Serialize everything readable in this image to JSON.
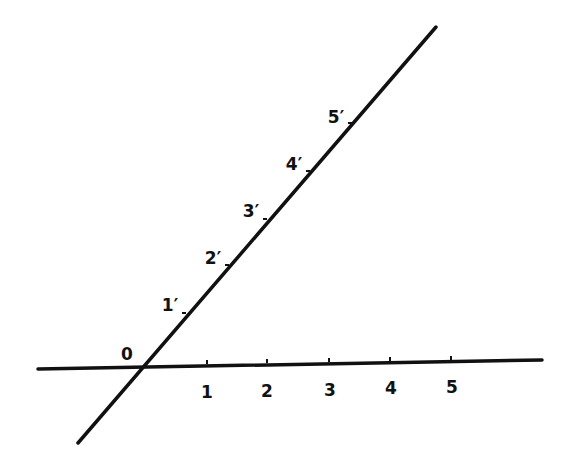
{
  "diagram": {
    "colors": {
      "line": "#111111",
      "background": "#ffffff"
    },
    "origin": {
      "label": "0",
      "x": 143,
      "y": 366,
      "label_x": 127,
      "label_y": 360
    },
    "horizontal_line": {
      "x1": 38,
      "y1": 369,
      "x2": 542,
      "y2": 360,
      "ticks": [
        {
          "label": "1",
          "x": 207,
          "y": 364,
          "label_x": 207,
          "label_y": 398
        },
        {
          "label": "2",
          "x": 267,
          "y": 363,
          "label_x": 267,
          "label_y": 397
        },
        {
          "label": "3",
          "x": 329,
          "y": 362,
          "label_x": 330,
          "label_y": 396
        },
        {
          "label": "4",
          "x": 390,
          "y": 361,
          "label_x": 391,
          "label_y": 394
        },
        {
          "label": "5",
          "x": 451,
          "y": 360,
          "label_x": 452,
          "label_y": 393
        }
      ]
    },
    "diagonal_line": {
      "x1": 78,
      "y1": 443,
      "x2": 436,
      "y2": 27,
      "ticks": [
        {
          "label": "1′",
          "x": 186,
          "y": 312,
          "label_x": 170,
          "label_y": 311
        },
        {
          "label": "2′",
          "x": 229,
          "y": 264,
          "label_x": 213,
          "label_y": 264
        },
        {
          "label": "3′",
          "x": 267,
          "y": 218,
          "label_x": 251,
          "label_y": 217
        },
        {
          "label": "4′",
          "x": 310,
          "y": 170,
          "label_x": 294,
          "label_y": 170
        },
        {
          "label": "5′",
          "x": 352,
          "y": 122,
          "label_x": 336,
          "label_y": 123
        }
      ]
    }
  }
}
